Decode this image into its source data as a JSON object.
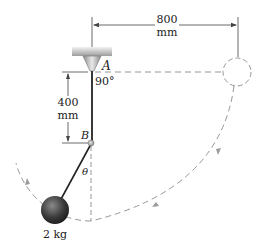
{
  "figure": {
    "type": "pendulum-mechanics-diagram",
    "labels": {
      "pivot_a": "A",
      "peg_b": "B",
      "angle_at_a": "90°",
      "angle_theta": "θ",
      "horizontal_dim_value": "800",
      "horizontal_dim_unit": "mm",
      "vertical_dim_value": "400",
      "vertical_dim_unit": "mm",
      "mass": "2 kg"
    },
    "colors": {
      "ink": "#222222",
      "dashed": "#8a8a8a",
      "support": "#b9b9b9",
      "ball": "#3a3a3a"
    }
  }
}
